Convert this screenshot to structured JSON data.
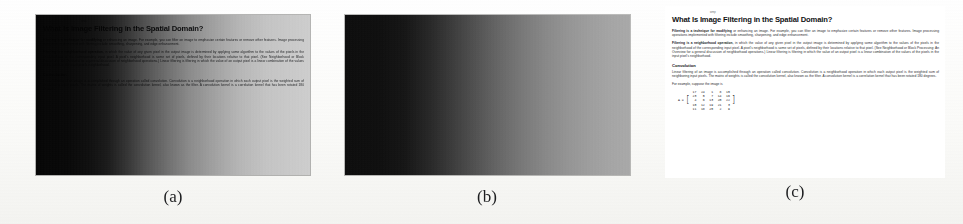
{
  "figure": {
    "caption_a": "(a)",
    "caption_b": "(b)",
    "caption_c": "(c)",
    "background_color": "#fdfdfb"
  },
  "document": {
    "header_note": "wmp",
    "title": "What Is Image Filtering in the Spatial Domain?",
    "paragraphs": [
      {
        "bold_lead": "Filtering is a technique for modifying",
        "text": " or enhancing an image. For example, you can filter an image to emphasize certain features or remove other features. Image processing operations implemented with filtering include smoothing, sharpening, and edge enhancement."
      },
      {
        "bold_lead": "Filtering is a neighborhood operation,",
        "text": " in which the value of any given pixel in the output image is determined by applying some algorithm to the values of the pixels in the neighborhood of the corresponding input pixel. A pixel's neighborhood is some set of pixels, defined by their locations relative to that pixel. (See Neighborhood or Block Processing: An Overview for a general discussion of neighborhood operations.) Linear filtering is filtering in which the value of an output pixel is a linear combination of the values of the pixels in the input pixel's neighborhood."
      }
    ],
    "section_heading": "Convolution",
    "section_text": "Linear filtering of an image is accomplished through an operation called convolution. Convolution is a neighborhood operation in which each output pixel is the weighted sum of neighboring input pixels. The matrix of weights is called the convolution kernel, also known as the filter. A convolution kernel is a correlation kernel that has been rotated 180 degrees.",
    "example_text": "For example, suppose the image is",
    "matrix": {
      "variable": "A =",
      "rows": [
        [
          "17",
          "24",
          "1",
          "8",
          "15"
        ],
        [
          "23",
          "5",
          "7",
          "14",
          "16"
        ],
        [
          "4",
          "6",
          "13",
          "20",
          "22"
        ],
        [
          "10",
          "12",
          "19",
          "21",
          "3"
        ],
        [
          "11",
          "18",
          "25",
          "2",
          "9"
        ]
      ]
    }
  },
  "panels": {
    "a": {
      "label": "degraded-document-with-illumination-gradient"
    },
    "b": {
      "label": "estimated-illumination-gradient"
    },
    "c": {
      "label": "restored-document"
    }
  }
}
